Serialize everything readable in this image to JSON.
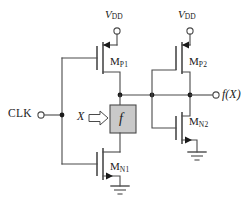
{
  "figure": {
    "kind": "schematic",
    "background_color": "#ffffff",
    "wire_color": "#4a4a4a",
    "node_color": "#1a1a1a",
    "block_fill": "#c9c9c9"
  },
  "labels": {
    "supply_left": {
      "text": "V",
      "subscript": "DD"
    },
    "supply_right": {
      "text": "V",
      "subscript": "DD"
    },
    "clock_input": "CLK",
    "data_input": "X",
    "output": "f(X)",
    "function_block": "f",
    "device_p1": {
      "text": "M",
      "subscript": "P1"
    },
    "device_p2": {
      "text": "M",
      "subscript": "P2"
    },
    "device_n1": {
      "text": "M",
      "subscript": "N1"
    },
    "device_n2": {
      "text": "M",
      "subscript": "N2"
    }
  },
  "devices": [
    {
      "id": "MP1",
      "type": "pmos",
      "label": "M",
      "sub": "P1"
    },
    {
      "id": "MP2",
      "type": "pmos",
      "label": "M",
      "sub": "P2"
    },
    {
      "id": "MN1",
      "type": "nmos",
      "label": "M",
      "sub": "N1"
    },
    {
      "id": "MN2",
      "type": "nmos",
      "label": "M",
      "sub": "N2"
    }
  ],
  "terminals": [
    {
      "id": "vdd-left",
      "kind": "supply",
      "label": "VDD"
    },
    {
      "id": "vdd-right",
      "kind": "supply",
      "label": "VDD"
    },
    {
      "id": "clk",
      "kind": "input",
      "label": "CLK"
    },
    {
      "id": "fx",
      "kind": "output",
      "label": "f(X)"
    }
  ],
  "grounds": [
    {
      "id": "gnd-n1"
    },
    {
      "id": "gnd-n2"
    }
  ],
  "icons": {
    "ground": "ground-icon",
    "open_terminal": "open-terminal-icon",
    "block_arrow": "block-arrow-right-icon"
  }
}
